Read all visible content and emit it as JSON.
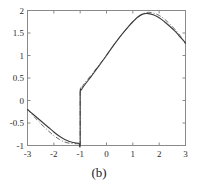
{
  "figure": {
    "caption": "(b)"
  },
  "chart_data": {
    "type": "line",
    "title": "",
    "xlabel": "",
    "ylabel": "",
    "xlim": [
      -3,
      3
    ],
    "ylim": [
      -1,
      2
    ],
    "grid": false,
    "legend_position": "none",
    "xticks": [
      -3,
      -2,
      -1,
      0,
      1,
      2,
      3
    ],
    "xtick_labels": [
      "-3",
      "-2",
      "-1",
      "0",
      "1",
      "2",
      "3"
    ],
    "yticks": [
      -1,
      -0.5,
      0,
      0.5,
      1,
      1.5,
      2
    ],
    "ytick_labels": [
      "-1",
      "-0.5",
      "0",
      "0.5",
      "1",
      "1.5",
      "2"
    ],
    "annotations": [
      "jump discontinuity at x = -1",
      "left branch falls from about -0.2 to a flat minimum near -0.95",
      "right branch rises from about 0.15 to a peak of about 1.93 near x = 1.4, then falls to about 1.28 at x = 3"
    ],
    "series": [
      {
        "name": "solid-curve",
        "style": "solid",
        "color": "#3a3a3a",
        "x": [
          -3.0,
          -2.8,
          -2.6,
          -2.4,
          -2.2,
          -2.0,
          -1.8,
          -1.6,
          -1.4,
          -1.2,
          -1.05,
          -1.0,
          -1.0,
          -0.95,
          -0.8,
          -0.6,
          -0.4,
          -0.2,
          0.0,
          0.2,
          0.4,
          0.6,
          0.8,
          1.0,
          1.2,
          1.4,
          1.6,
          1.8,
          2.0,
          2.2,
          2.4,
          2.6,
          2.8,
          3.0
        ],
        "y": [
          -0.2,
          -0.3,
          -0.4,
          -0.5,
          -0.6,
          -0.7,
          -0.79,
          -0.86,
          -0.91,
          -0.94,
          -0.95,
          -0.95,
          0.15,
          0.24,
          0.37,
          0.52,
          0.68,
          0.84,
          1.0,
          1.17,
          1.33,
          1.48,
          1.62,
          1.75,
          1.86,
          1.925,
          1.93,
          1.9,
          1.84,
          1.75,
          1.65,
          1.54,
          1.41,
          1.28
        ]
      },
      {
        "name": "dash-dot-curve",
        "style": "dashdot",
        "color": "#6e6e6e",
        "x": [
          -3.0,
          -2.8,
          -2.6,
          -2.4,
          -2.2,
          -2.0,
          -1.8,
          -1.6,
          -1.4,
          -1.2,
          -1.05,
          -1.0,
          -1.0,
          -0.95,
          -0.8,
          -0.6,
          -0.4,
          -0.2,
          0.0,
          0.2,
          0.4,
          0.6,
          0.8,
          1.0,
          1.2,
          1.4,
          1.6,
          1.8,
          2.0,
          2.2,
          2.4,
          2.6,
          2.8,
          3.0
        ],
        "y": [
          -0.19,
          -0.33,
          -0.45,
          -0.57,
          -0.68,
          -0.78,
          -0.86,
          -0.92,
          -0.95,
          -0.96,
          -0.96,
          -0.96,
          0.17,
          0.28,
          0.41,
          0.55,
          0.7,
          0.85,
          1.01,
          1.17,
          1.33,
          1.48,
          1.62,
          1.75,
          1.85,
          1.93,
          1.96,
          1.94,
          1.89,
          1.81,
          1.7,
          1.58,
          1.44,
          1.25
        ]
      }
    ]
  }
}
